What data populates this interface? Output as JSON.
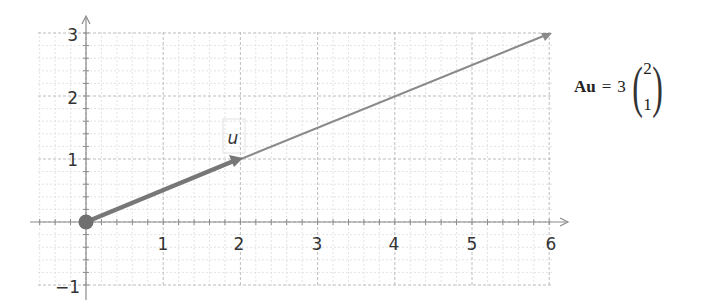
{
  "chart_data": {
    "type": "vector-plot",
    "title": "",
    "xlabel": "",
    "ylabel": "",
    "xlim": [
      -0.6,
      6.0
    ],
    "ylim": [
      -1.0,
      3.0
    ],
    "grid": true,
    "minor_grid_step": 0.2,
    "x_ticks": [
      "1",
      "2",
      "3",
      "4",
      "5",
      "6"
    ],
    "y_ticks": [
      "3",
      "2",
      "1",
      "-1"
    ],
    "vectors": [
      {
        "name": "u",
        "from": [
          0,
          0
        ],
        "to": [
          2,
          1
        ],
        "style": "thick",
        "color": "#777777"
      },
      {
        "name": "Au",
        "from": [
          0,
          0
        ],
        "to": [
          6,
          3
        ],
        "style": "thin",
        "color": "#888888"
      }
    ],
    "origin_point": [
      0,
      0
    ]
  },
  "plot": {
    "vector_label": "u",
    "x_ticks": [
      "1",
      "2",
      "3",
      "4",
      "5",
      "6"
    ],
    "y_ticks": [
      "3",
      "2",
      "1",
      "−1"
    ]
  },
  "equation": {
    "lhs": "Au",
    "equals": "=",
    "scalar": "3",
    "vector_top": "2",
    "vector_bottom": "1"
  },
  "colors": {
    "grid_major": "#b8b8b8",
    "grid_minor": "#dcdcdc",
    "axis": "#888888",
    "vector": "#7a7a7a",
    "text": "#333333"
  }
}
